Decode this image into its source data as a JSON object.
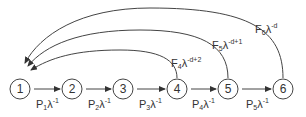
{
  "diagram": {
    "type": "state-transition",
    "nodes": [
      {
        "id": "1",
        "label": "1",
        "cx": 20,
        "cy": 89
      },
      {
        "id": "2",
        "label": "2",
        "cx": 72,
        "cy": 89
      },
      {
        "id": "3",
        "label": "3",
        "cx": 123,
        "cy": 89
      },
      {
        "id": "4",
        "label": "4",
        "cx": 177,
        "cy": 89
      },
      {
        "id": "5",
        "label": "5",
        "cx": 228,
        "cy": 89
      },
      {
        "id": "6",
        "label": "6",
        "cx": 283,
        "cy": 89
      }
    ],
    "forward_edges": [
      {
        "from": "1",
        "to": "2",
        "base": "P",
        "sub": "1",
        "lambda": "λ",
        "exp": "-1"
      },
      {
        "from": "2",
        "to": "3",
        "base": "P",
        "sub": "2",
        "lambda": "λ",
        "exp": "-1"
      },
      {
        "from": "3",
        "to": "4",
        "base": "P",
        "sub": "3",
        "lambda": "λ",
        "exp": "-1"
      },
      {
        "from": "4",
        "to": "5",
        "base": "P",
        "sub": "4",
        "lambda": "λ",
        "exp": "-1"
      },
      {
        "from": "5",
        "to": "6",
        "base": "P",
        "sub": "5",
        "lambda": "λ",
        "exp": "-1"
      }
    ],
    "back_edges": [
      {
        "from": "4",
        "to": "1",
        "base": "F",
        "sub": "4",
        "lambda": "λ",
        "exp": "-d+2"
      },
      {
        "from": "5",
        "to": "1",
        "base": "F",
        "sub": "5",
        "lambda": "λ",
        "exp": "-d+1"
      },
      {
        "from": "6",
        "to": "1",
        "base": "F",
        "sub": "6",
        "lambda": "λ",
        "exp": "-d"
      }
    ],
    "colors": {
      "stroke": "#444444",
      "text": "#333333"
    }
  }
}
